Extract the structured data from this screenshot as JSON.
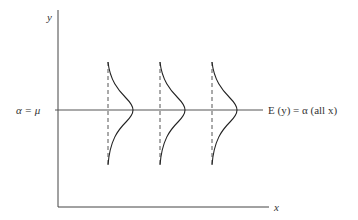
{
  "diagram": {
    "axes": {
      "x_label": "x",
      "y_label": "y"
    },
    "y_intercept_label": "α = μ",
    "mean_line_label": "E (y) = α (all x)",
    "distributions": [
      {
        "id": 1,
        "x": 108
      },
      {
        "id": 2,
        "x": 160
      },
      {
        "id": 3,
        "x": 212
      }
    ],
    "colors": {
      "line": "#444444",
      "curve": "#222222",
      "background": "#ffffff"
    }
  }
}
